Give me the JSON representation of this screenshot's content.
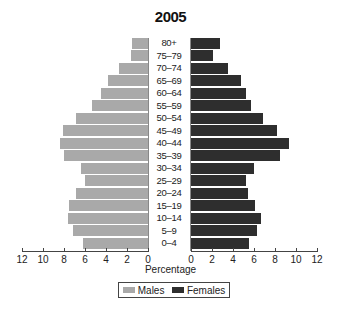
{
  "chart_data": {
    "type": "bar",
    "orientation": "horizontal",
    "subtype": "population-pyramid",
    "title": "2005",
    "xlabel": "Percentage",
    "ylabel": "",
    "categories": [
      "80+",
      "75–79",
      "70–74",
      "65–69",
      "60–64",
      "55–59",
      "50–54",
      "45–49",
      "40–44",
      "35–39",
      "30–34",
      "25–29",
      "20–24",
      "15–19",
      "10–14",
      "5–9",
      "0–4"
    ],
    "series": [
      {
        "name": "Males",
        "color": "#a9a9a9",
        "side": "left",
        "values": [
          1.5,
          1.6,
          2.8,
          3.8,
          4.5,
          5.3,
          6.9,
          8.1,
          8.4,
          8.0,
          6.4,
          6.0,
          6.9,
          7.5,
          7.6,
          7.1,
          6.2
        ]
      },
      {
        "name": "Females",
        "color": "#2e2e2e",
        "side": "right",
        "values": [
          2.8,
          2.1,
          3.5,
          4.8,
          5.2,
          5.7,
          6.9,
          8.2,
          9.3,
          8.5,
          6.0,
          5.2,
          5.4,
          6.1,
          6.7,
          6.3,
          5.5
        ]
      }
    ],
    "xlim": [
      0,
      12
    ],
    "x_ticks_left": [
      "12",
      "10",
      "8",
      "6",
      "4",
      "2",
      "0"
    ],
    "x_ticks_right": [
      "0",
      "2",
      "4",
      "6",
      "8",
      "10",
      "12"
    ],
    "grid": false,
    "legend_position": "bottom"
  },
  "legend": {
    "males": "Males",
    "females": "Females"
  }
}
